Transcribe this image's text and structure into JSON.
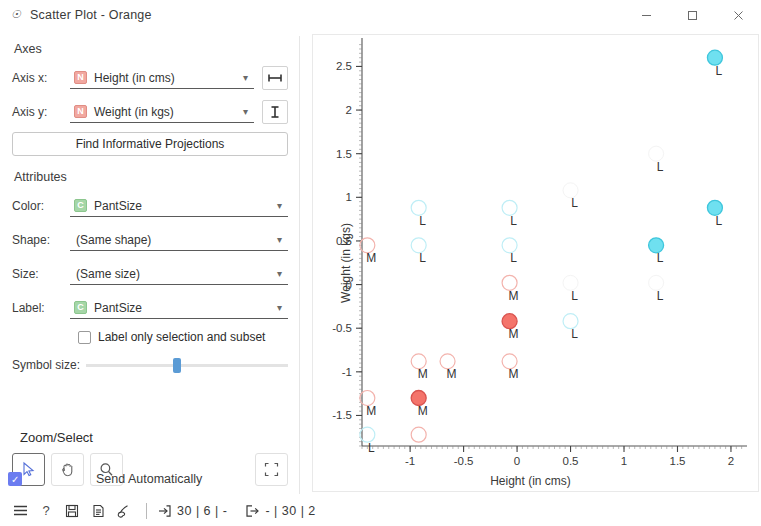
{
  "window": {
    "title": "Scatter Plot - Orange",
    "app_icon": "orange-widget-icon",
    "minimize": "—",
    "maximize": "□",
    "close": "✕"
  },
  "panel": {
    "axes": {
      "section_title": "Axes",
      "axis_x_label": "Axis x:",
      "axis_x_value": "Height (in cms)",
      "axis_x_vartype": "N",
      "axis_y_label": "Axis y:",
      "axis_y_value": "Weight (in kgs)",
      "axis_y_vartype": "N",
      "find_projections_button": "Find Informative Projections"
    },
    "attributes": {
      "section_title": "Attributes",
      "color_label": "Color:",
      "color_value": "PantSize",
      "color_vartype": "C",
      "shape_label": "Shape:",
      "shape_value": "(Same shape)",
      "size_label": "Size:",
      "size_value": "(Same size)",
      "label_label": "Label:",
      "label_value": "PantSize",
      "label_vartype": "C",
      "label_only_selection": "Label only selection and subset",
      "label_only_selection_checked": false,
      "symbol_size_label": "Symbol size:",
      "symbol_size_percent": 43
    },
    "zoom_select": {
      "title": "Zoom/Select",
      "tools": [
        {
          "name": "select-tool",
          "glyph": "arrow",
          "active": true
        },
        {
          "name": "pan-tool",
          "glyph": "hand",
          "active": false
        },
        {
          "name": "zoom-tool",
          "glyph": "magnifier",
          "active": false
        }
      ],
      "reset_zoom": "fit-to-screen"
    },
    "send_automatically": {
      "label": "Send Automatically",
      "checked": true
    }
  },
  "statusbar": {
    "icons": [
      "menu-icon",
      "help-icon",
      "save-icon",
      "report-icon",
      "brush-icon"
    ],
    "input_icon": "input-arrow-icon",
    "input_text": "30 | 6 | -",
    "output_icon": "output-arrow-icon",
    "output_text": "- | 30 | 2"
  },
  "collapse_handle": "❯",
  "chart_data": {
    "type": "scatter",
    "title": "",
    "xlabel": "Height (in cms)",
    "ylabel": "Weight (in kgs)",
    "xlim": [
      -1.45,
      2.15
    ],
    "ylim": [
      -1.85,
      2.78
    ],
    "xticks": [
      -1,
      -0.5,
      0,
      0.5,
      1,
      1.5,
      2
    ],
    "xticklabels": [
      "-1",
      "-0.5",
      "0",
      "0.5",
      "1",
      "1.5",
      "2"
    ],
    "yticks": [
      -1.5,
      -1,
      -0.5,
      0,
      0.5,
      1,
      1.5,
      2,
      2.5
    ],
    "yticklabels": [
      "-1.5",
      "-1",
      "-0.5",
      "0",
      "0.5",
      "1",
      "1.5",
      "2",
      "2.5"
    ],
    "grid": false,
    "legend": "none",
    "colors": {
      "L": "#6fe0f0",
      "M": "#f4746b",
      "L_faded": "#d8f5fa",
      "M_faded": "#fbdedb",
      "ghost": "#f2f2f2"
    },
    "points": [
      {
        "x": 1.85,
        "y": 2.6,
        "label": "L",
        "group": "L",
        "state": "selected"
      },
      {
        "x": 1.3,
        "y": 1.5,
        "label": "L",
        "group": "L",
        "state": "ghost"
      },
      {
        "x": 0.5,
        "y": 1.08,
        "label": "L",
        "group": "L",
        "state": "ghost"
      },
      {
        "x": -0.92,
        "y": 0.88,
        "label": "L",
        "group": "L",
        "state": "subset"
      },
      {
        "x": -0.07,
        "y": 0.88,
        "label": "L",
        "group": "L",
        "state": "subset"
      },
      {
        "x": 1.85,
        "y": 0.88,
        "label": "L",
        "group": "L",
        "state": "selected"
      },
      {
        "x": -1.4,
        "y": 0.45,
        "label": "M",
        "group": "M",
        "state": "subset"
      },
      {
        "x": -0.92,
        "y": 0.45,
        "label": "L",
        "group": "L",
        "state": "subset"
      },
      {
        "x": -0.07,
        "y": 0.45,
        "label": "L",
        "group": "L",
        "state": "subset"
      },
      {
        "x": 1.3,
        "y": 0.45,
        "label": "L",
        "group": "L",
        "state": "selected"
      },
      {
        "x": -0.07,
        "y": 0.02,
        "label": "M",
        "group": "M",
        "state": "subset"
      },
      {
        "x": 0.5,
        "y": 0.02,
        "label": "L",
        "group": "L",
        "state": "ghost"
      },
      {
        "x": 1.3,
        "y": 0.02,
        "label": "L",
        "group": "L",
        "state": "ghost"
      },
      {
        "x": -0.07,
        "y": -0.42,
        "label": "M",
        "group": "M",
        "state": "selected"
      },
      {
        "x": 0.5,
        "y": -0.42,
        "label": "L",
        "group": "L",
        "state": "subset"
      },
      {
        "x": -0.92,
        "y": -0.88,
        "label": "M",
        "group": "M",
        "state": "subset"
      },
      {
        "x": -0.65,
        "y": -0.88,
        "label": "M",
        "group": "M",
        "state": "subset"
      },
      {
        "x": -0.07,
        "y": -0.88,
        "label": "M",
        "group": "M",
        "state": "subset"
      },
      {
        "x": -1.4,
        "y": -1.3,
        "label": "M",
        "group": "M",
        "state": "subset"
      },
      {
        "x": -0.92,
        "y": -1.3,
        "label": "M",
        "group": "M",
        "state": "selected"
      },
      {
        "x": -1.4,
        "y": -1.72,
        "label": "L",
        "group": "L",
        "state": "subset"
      },
      {
        "x": -0.92,
        "y": -1.72,
        "label": "",
        "group": "M",
        "state": "subset"
      }
    ]
  }
}
